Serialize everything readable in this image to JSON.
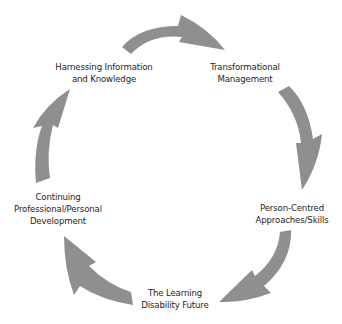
{
  "diagram": {
    "type": "cycle",
    "direction": "clockwise",
    "arrow_color": "#8f8f8f",
    "text_color": "#1e1e1e",
    "nodes": [
      {
        "id": "harnessing",
        "lines": [
          "Harnessing Information",
          "and Knowledge"
        ]
      },
      {
        "id": "transformational",
        "lines": [
          "Transformational",
          "Management"
        ]
      },
      {
        "id": "person-centred",
        "lines": [
          "Person-Centred",
          "Approaches/Skills"
        ]
      },
      {
        "id": "learning-disability",
        "lines": [
          "The Learning",
          "Disability Future"
        ]
      },
      {
        "id": "continuing",
        "lines": [
          "Continuing",
          "Professional/Personal",
          "Development"
        ]
      }
    ],
    "arrows": [
      {
        "from": "harnessing",
        "to": "transformational"
      },
      {
        "from": "transformational",
        "to": "person-centred"
      },
      {
        "from": "person-centred",
        "to": "learning-disability"
      },
      {
        "from": "learning-disability",
        "to": "continuing"
      },
      {
        "from": "continuing",
        "to": "harnessing"
      }
    ]
  }
}
